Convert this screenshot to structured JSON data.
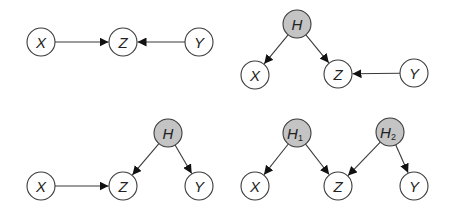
{
  "figure": {
    "width": 453,
    "height": 215,
    "node_radius": 14,
    "colors": {
      "observed_fill": "#ffffff",
      "hidden_fill": "#c4c4c4",
      "stroke": "#3a3a3a",
      "label": "#222222"
    },
    "panels": [
      {
        "id": "top-left",
        "nodes": [
          {
            "id": "X",
            "label": "X",
            "sub": "",
            "x": 41,
            "y": 42,
            "hidden": false
          },
          {
            "id": "Z",
            "label": "Z",
            "sub": "",
            "x": 123,
            "y": 42,
            "hidden": false
          },
          {
            "id": "Y",
            "label": "Y",
            "sub": "",
            "x": 199,
            "y": 42,
            "hidden": false
          }
        ],
        "edges": [
          {
            "from": "X",
            "to": "Z"
          },
          {
            "from": "Y",
            "to": "Z"
          }
        ]
      },
      {
        "id": "top-right",
        "nodes": [
          {
            "id": "H",
            "label": "H",
            "sub": "",
            "x": 297,
            "y": 24,
            "hidden": true
          },
          {
            "id": "X",
            "label": "X",
            "sub": "",
            "x": 255,
            "y": 75,
            "hidden": false
          },
          {
            "id": "Z",
            "label": "Z",
            "sub": "",
            "x": 338,
            "y": 74,
            "hidden": false
          },
          {
            "id": "Y",
            "label": "Y",
            "sub": "",
            "x": 414,
            "y": 73,
            "hidden": false
          }
        ],
        "edges": [
          {
            "from": "H",
            "to": "X"
          },
          {
            "from": "H",
            "to": "Z"
          },
          {
            "from": "Y",
            "to": "Z"
          }
        ]
      },
      {
        "id": "bottom-left",
        "nodes": [
          {
            "id": "H",
            "label": "H",
            "sub": "",
            "x": 168,
            "y": 133,
            "hidden": true
          },
          {
            "id": "X",
            "label": "X",
            "sub": "",
            "x": 41,
            "y": 186,
            "hidden": false
          },
          {
            "id": "Z",
            "label": "Z",
            "sub": "",
            "x": 123,
            "y": 186,
            "hidden": false
          },
          {
            "id": "Y",
            "label": "Y",
            "sub": "",
            "x": 199,
            "y": 186,
            "hidden": false
          }
        ],
        "edges": [
          {
            "from": "X",
            "to": "Z"
          },
          {
            "from": "H",
            "to": "Z"
          },
          {
            "from": "H",
            "to": "Y"
          }
        ]
      },
      {
        "id": "bottom-right",
        "nodes": [
          {
            "id": "H1",
            "label": "H",
            "sub": "1",
            "x": 297,
            "y": 133,
            "hidden": true
          },
          {
            "id": "H2",
            "label": "H",
            "sub": "2",
            "x": 390,
            "y": 132,
            "hidden": true
          },
          {
            "id": "X",
            "label": "X",
            "sub": "",
            "x": 255,
            "y": 186,
            "hidden": false
          },
          {
            "id": "Z",
            "label": "Z",
            "sub": "",
            "x": 338,
            "y": 186,
            "hidden": false
          },
          {
            "id": "Y",
            "label": "Y",
            "sub": "",
            "x": 414,
            "y": 186,
            "hidden": false
          }
        ],
        "edges": [
          {
            "from": "H1",
            "to": "X"
          },
          {
            "from": "H1",
            "to": "Z"
          },
          {
            "from": "H2",
            "to": "Z"
          },
          {
            "from": "H2",
            "to": "Y"
          }
        ]
      }
    ]
  }
}
